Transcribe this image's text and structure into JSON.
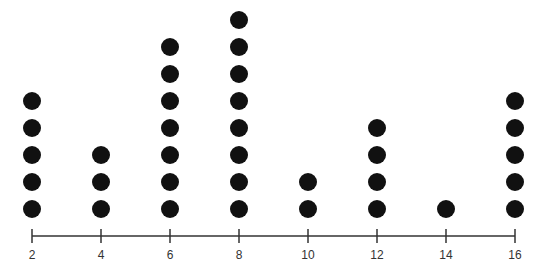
{
  "chart_data": {
    "type": "dot",
    "title": "",
    "xlabel": "",
    "ylabel": "",
    "categories": [
      2,
      4,
      6,
      8,
      10,
      12,
      14,
      16
    ],
    "values": [
      5,
      3,
      7,
      8,
      2,
      4,
      1,
      5
    ],
    "x_ticks": [
      "2",
      "4",
      "6",
      "8",
      "10",
      "12",
      "14",
      "16"
    ],
    "xlim": [
      2,
      16
    ],
    "grid": false,
    "legend": null,
    "dot_color": "#111111",
    "axis_color": "#333333"
  }
}
